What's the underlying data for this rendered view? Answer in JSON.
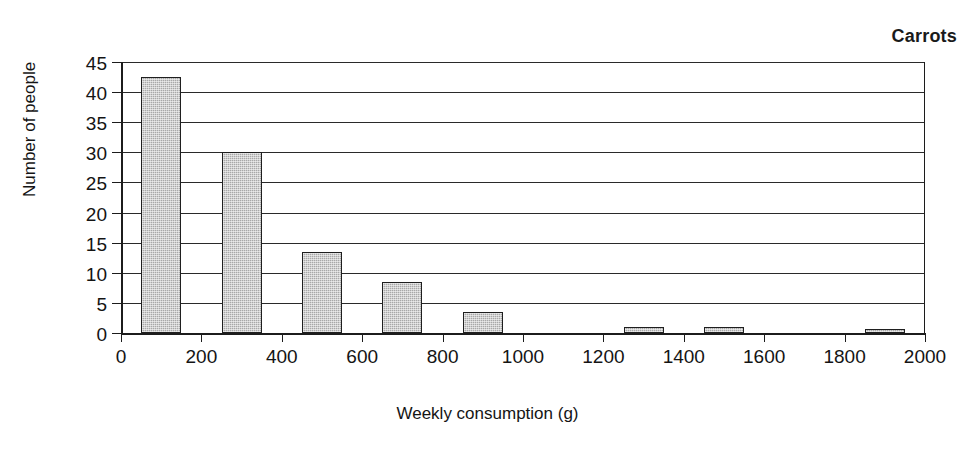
{
  "chart_data": {
    "type": "bar",
    "title": "Carrots",
    "xlabel": "Weekly consumption (g)",
    "ylabel": "Number of people",
    "grid": "horizontal",
    "legend": "none",
    "xlim": [
      0,
      2000
    ],
    "ylim": [
      0,
      45
    ],
    "xticks": [
      0,
      200,
      400,
      600,
      800,
      1000,
      1200,
      1400,
      1600,
      1800,
      2000
    ],
    "yticks": [
      0,
      5,
      10,
      15,
      20,
      25,
      30,
      35,
      40,
      45
    ],
    "xtick_labels": [
      "0",
      "200",
      "400",
      "600",
      "800",
      "1000",
      "1200",
      "1400",
      "1600",
      "1800",
      "2000"
    ],
    "ytick_labels": [
      "0",
      "5",
      "10",
      "15",
      "20",
      "25",
      "30",
      "35",
      "40",
      "45"
    ],
    "bin_width": 200,
    "bar_fill_color": "#a8a8a8",
    "bar_edge_color": "#1f1f1f",
    "categories": [
      "0-200",
      "200-400",
      "400-600",
      "600-800",
      "800-1000",
      "1000-1200",
      "1200-1400",
      "1400-1600",
      "1600-1800",
      "1800-2000"
    ],
    "bin_centers": [
      100,
      300,
      500,
      700,
      900,
      1100,
      1300,
      1500,
      1700,
      1900
    ],
    "values": [
      42.5,
      30,
      13.5,
      8.5,
      3.5,
      0,
      1,
      1,
      0,
      0.7
    ]
  }
}
